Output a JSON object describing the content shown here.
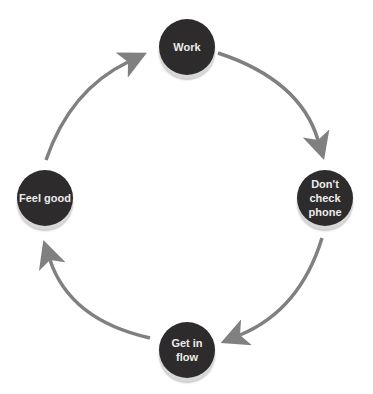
{
  "diagram": {
    "type": "cycle",
    "nodes": [
      {
        "id": "work",
        "label": "Work"
      },
      {
        "id": "dont-check-phone",
        "label": "Don't check phone"
      },
      {
        "id": "get-in-flow",
        "label": "Get in flow"
      },
      {
        "id": "feel-good",
        "label": "Feel good"
      }
    ],
    "edges": [
      {
        "from": "work",
        "to": "dont-check-phone"
      },
      {
        "from": "dont-check-phone",
        "to": "get-in-flow"
      },
      {
        "from": "get-in-flow",
        "to": "feel-good"
      },
      {
        "from": "feel-good",
        "to": "work"
      }
    ],
    "colors": {
      "node_fill": "#2e2b2c",
      "node_text": "#ececec",
      "arrow": "#808080",
      "background": "#ffffff"
    }
  }
}
